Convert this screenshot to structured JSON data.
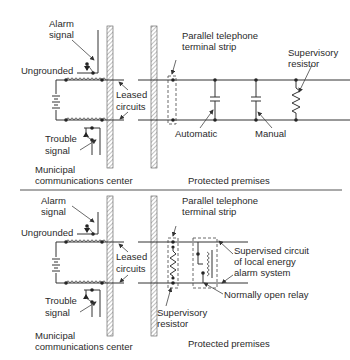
{
  "panels": [
    {
      "id": "top",
      "labels": {
        "alarm_signal_1": "Alarm",
        "alarm_signal_2": "signal",
        "ungrounded": "Ungrounded",
        "leased_1": "Leased",
        "leased_2": "circuits",
        "trouble_1": "Trouble",
        "trouble_2": "signal",
        "municipal_1": "Municipal",
        "municipal_2": "communications center",
        "strip_1": "Parallel telephone",
        "strip_2": "terminal strip",
        "supervisory_1": "Supervisory",
        "supervisory_2": "resistor",
        "automatic": "Automatic",
        "manual": "Manual",
        "protected": "Protected premises"
      }
    },
    {
      "id": "bottom",
      "labels": {
        "alarm_signal_1": "Alarm",
        "alarm_signal_2": "signal",
        "ungrounded": "Ungrounded",
        "leased_1": "Leased",
        "leased_2": "circuits",
        "trouble_1": "Trouble",
        "trouble_2": "signal",
        "municipal_1": "Municipal",
        "municipal_2": "communications center",
        "strip_1": "Parallel telephone",
        "strip_2": "terminal strip",
        "supervised_1": "Supervised circuit",
        "supervised_2": "of local energy",
        "supervised_3": "alarm system",
        "relay": "Normally open relay",
        "supervisory_1": "Supervisory",
        "supervisory_2": "resistor",
        "protected": "Protected premises"
      }
    }
  ]
}
